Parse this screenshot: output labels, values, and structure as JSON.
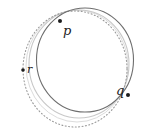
{
  "figure": {
    "width": 136,
    "height": 136,
    "background_color": "#ffffff"
  },
  "curves": [
    {
      "name": "solid-circle",
      "style": "solid",
      "color": "#6e6e6e",
      "stroke_width": 1.1,
      "cx": 85,
      "cy": 60,
      "rx": 48.5,
      "ry": 52
    },
    {
      "name": "dotted-circle",
      "style": "dotted",
      "color": "#9a9a9a",
      "stroke_width": 1.1,
      "cx": 75,
      "cy": 69,
      "rx": 52,
      "ry": 58
    },
    {
      "name": "light-gray-circle",
      "style": "solid",
      "color": "#c8c8c8",
      "stroke_width": 1.1,
      "cx": 79,
      "cy": 64,
      "rx": 50,
      "ry": 54
    },
    {
      "name": "faint-gray-circle",
      "style": "solid",
      "color": "#dcdcdc",
      "stroke_width": 1.0,
      "cx": 77,
      "cy": 66,
      "rx": 51,
      "ry": 56
    }
  ],
  "points": [
    {
      "id": "p",
      "label": "p",
      "dot_x": 60,
      "dot_y": 21,
      "label_x": 63,
      "label_y": 24,
      "dot_radius": 2.0,
      "color": "#1c1c1c"
    },
    {
      "id": "q",
      "label": "q",
      "dot_x": 128,
      "dot_y": 95,
      "label_x": 116,
      "label_y": 84,
      "dot_radius": 2.0,
      "color": "#1c1c1c"
    },
    {
      "id": "r",
      "label": "r",
      "dot_x": 23,
      "dot_y": 70,
      "label_x": 27,
      "label_y": 64,
      "dot_radius": 1.8,
      "color": "#1c1c1c"
    }
  ]
}
